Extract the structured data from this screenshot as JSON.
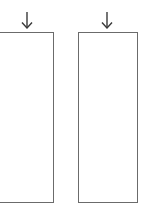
{
  "diagram": {
    "stroke_color": "#6b6b6b",
    "background": "#ffffff",
    "columns": [
      {
        "name": "left",
        "arrow": {
          "icon": "arrow-down-icon",
          "x": 27,
          "y_top": 12,
          "y_bottom": 29
        },
        "box": {
          "left": -4,
          "top": 32,
          "right": 54,
          "bottom": 203,
          "label": ""
        }
      },
      {
        "name": "right",
        "arrow": {
          "icon": "arrow-down-icon",
          "x": 107,
          "y_top": 12,
          "y_bottom": 29
        },
        "box": {
          "left": 78,
          "top": 32,
          "right": 138,
          "bottom": 203,
          "label": ""
        }
      }
    ]
  }
}
